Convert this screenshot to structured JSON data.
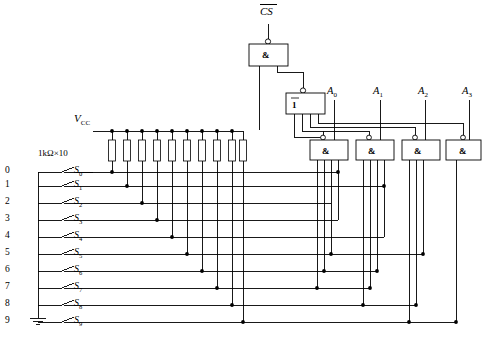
{
  "diagram": {
    "chip_select_label": "CS",
    "vcc_label": "VCC",
    "vcc_label_main": "V",
    "vcc_label_sub": "CC",
    "resistor_bank_label": "1kΩ×10",
    "resistor_count": 10,
    "ground_label": "",
    "enable_gate_symbol": "&",
    "inverter_symbol": "1",
    "and_gate_symbol": "&",
    "output_gate_count": 4,
    "colors": {
      "wire": "#000000",
      "background": "#ffffff",
      "box_fill": "#ffffff",
      "junction": "#000000"
    },
    "key_rows": [
      {
        "index": "0",
        "switch": "S",
        "sub": "0"
      },
      {
        "index": "1",
        "switch": "S",
        "sub": "1"
      },
      {
        "index": "2",
        "switch": "S",
        "sub": "2"
      },
      {
        "index": "3",
        "switch": "S",
        "sub": "3"
      },
      {
        "index": "4",
        "switch": "S",
        "sub": "4"
      },
      {
        "index": "5",
        "switch": "S",
        "sub": "5"
      },
      {
        "index": "6",
        "switch": "S",
        "sub": "6"
      },
      {
        "index": "7",
        "switch": "S",
        "sub": "7"
      },
      {
        "index": "8",
        "switch": "S",
        "sub": "8"
      },
      {
        "index": "9",
        "switch": "S",
        "sub": "9"
      }
    ],
    "outputs": [
      {
        "name": "A",
        "sub": "0",
        "gate_inputs": 4
      },
      {
        "name": "A",
        "sub": "1",
        "gate_inputs": 4
      },
      {
        "name": "A",
        "sub": "2",
        "gate_inputs": 3
      },
      {
        "name": "A",
        "sub": "3",
        "gate_inputs": 2
      }
    ]
  }
}
